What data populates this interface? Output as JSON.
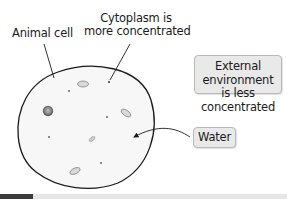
{
  "labels": {
    "animal_cell": "Animal cell",
    "cytoplasm_line1": "Cytoplasm is",
    "cytoplasm_line2": "more concentrated",
    "external_line1": "External environment",
    "external_line2": "is less concentrated",
    "water": "Water"
  },
  "colors": {
    "cell_outline": "#1a1a1a",
    "cell_fill": "#f6f6f6",
    "organelle_fill": "#d8d8d8",
    "nucleus_fill": "#7a7a7a",
    "box_fill": "#e9e9e9",
    "box_border": "#b8b8b8",
    "progress_dark": "#3a3a3a",
    "progress_light": "#e6e6e6"
  }
}
